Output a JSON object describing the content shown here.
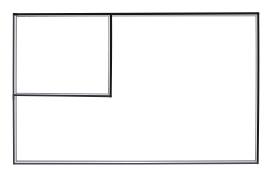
{
  "document": {
    "title": "Hand-drawn wireframe layout sketch",
    "kind": "wireframe-sketch",
    "width": 271,
    "height": 173,
    "background_color": "#ffffff",
    "ink_color": "#1c1c1c",
    "ink_color_light": "#6e6e78",
    "text_content": "",
    "notes": "Pen-on-paper style box diagram. No labels, no text, no icons rendered in the image."
  },
  "frame": {
    "name": "outer-frame",
    "label": "",
    "x": 13,
    "y": 13,
    "width": 245,
    "height": 151,
    "stroke_style": "double-pass hand drawn"
  },
  "dividers": [
    {
      "name": "vertical-divider",
      "orientation": "vertical",
      "label": "",
      "x": 111,
      "y_start": 13,
      "y_end": 96
    },
    {
      "name": "horizontal-divider",
      "orientation": "horizontal",
      "label": "",
      "y": 95,
      "x_start": 13,
      "x_end": 111
    }
  ],
  "panels": [
    {
      "name": "panel-top-left",
      "label": "",
      "content": "",
      "x": 16,
      "y": 16,
      "width": 94,
      "height": 79
    },
    {
      "name": "panel-right",
      "label": "",
      "content": "",
      "x": 112,
      "y": 16,
      "width": 145,
      "height": 145
    },
    {
      "name": "panel-bottom-left",
      "label": "",
      "content": "",
      "x": 16,
      "y": 97,
      "width": 94,
      "height": 64
    }
  ],
  "strokes": {
    "outer_top": "M 14.5 14.2 L 258.5 13.2",
    "outer_top_second": "M 16.0 16.4 L 256.8 15.6",
    "outer_right": "M 258.2 13.6 L 257.6 163.4",
    "outer_right_second": "M 256.2 16.0 L 255.6 161.0",
    "outer_bottom": "M 257.8 163.0 L 13.8 163.6",
    "outer_bottom_second": "M 255.6 160.8 L 16.0 161.2",
    "outer_left": "M 13.6 14.0 L 13.4 163.8",
    "outer_left_second": "M 16.2 16.2 L 16.0 161.2",
    "vertical_divider": "M 111.2 14.0 L 110.6 96.4",
    "vertical_divider_second": "M 108.8 16.6 L 108.4 93.8",
    "horizontal_divider": "M 13.8 95.0 L 111.0 96.2",
    "horizontal_divider_second": "M 16.2 93.2 L 108.8 94.0"
  }
}
